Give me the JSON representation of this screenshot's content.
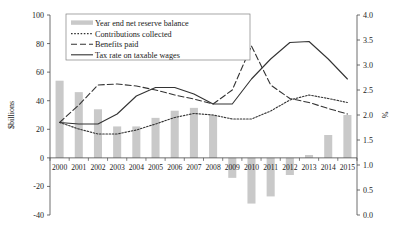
{
  "chart_data": {
    "type": "bar",
    "title": "",
    "categories": [
      "2000",
      "2001",
      "2002",
      "2003",
      "2004",
      "2005",
      "2006",
      "2007",
      "2008",
      "2009",
      "2010",
      "2011",
      "2012",
      "2013",
      "2014",
      "2015"
    ],
    "xlabel": "",
    "ylabel": "$billions",
    "ylabel_right": "%",
    "ylim": [
      -40,
      100
    ],
    "yticks": [
      -40,
      -20,
      0,
      20,
      40,
      60,
      80,
      100
    ],
    "ylim_right": [
      0.0,
      4.0
    ],
    "yticks_right": [
      0.0,
      0.5,
      1.0,
      1.5,
      2.0,
      2.5,
      3.0,
      3.5,
      4.0
    ],
    "grid": false,
    "legend_position": "top-center",
    "series": [
      {
        "name": "Year end net reserve balance",
        "type": "bar",
        "axis": "left",
        "color": "#c9c9c9",
        "values": [
          54,
          46,
          34,
          22,
          22,
          28,
          33,
          35,
          30,
          -14,
          -32,
          -27,
          -12,
          2,
          16,
          30
        ]
      },
      {
        "name": "Contributions collected",
        "type": "line",
        "style": "dotted",
        "axis": "right",
        "color": "#333333",
        "values": [
          1.85,
          1.72,
          1.62,
          1.62,
          1.7,
          1.82,
          1.95,
          2.03,
          2.0,
          1.92,
          1.92,
          2.08,
          2.3,
          2.4,
          2.33,
          2.25
        ]
      },
      {
        "name": "Benefits paid",
        "type": "line",
        "style": "dashed",
        "axis": "right",
        "color": "#333333",
        "values": [
          1.85,
          2.2,
          2.6,
          2.62,
          2.58,
          2.5,
          2.4,
          2.32,
          2.22,
          2.5,
          3.38,
          2.6,
          2.33,
          2.25,
          2.13,
          2.02
        ]
      },
      {
        "name": "Tax rate on taxable wages",
        "type": "line",
        "style": "solid",
        "axis": "right",
        "color": "#333333",
        "values": [
          1.85,
          1.82,
          1.82,
          2.02,
          2.38,
          2.55,
          2.55,
          2.42,
          2.22,
          2.22,
          2.72,
          3.12,
          3.45,
          3.47,
          3.12,
          2.72
        ]
      }
    ]
  },
  "legend": {
    "items": [
      {
        "label": "Year end net reserve balance",
        "marker": "bar-swatch"
      },
      {
        "label": "Contributions collected",
        "marker": "dotted-line"
      },
      {
        "label": "Benefits paid",
        "marker": "dashed-line"
      },
      {
        "label": "Tax rate on taxable wages",
        "marker": "solid-line"
      }
    ]
  },
  "axes": {
    "left_title": "$billions",
    "right_title": "%"
  }
}
